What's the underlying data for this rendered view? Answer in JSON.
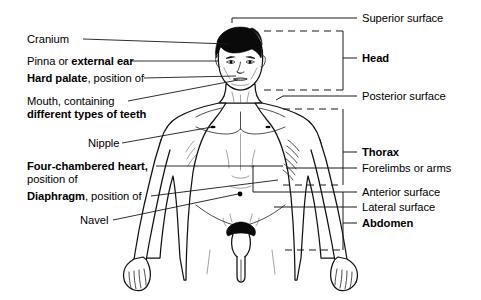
{
  "diagram": {
    "background_color": "#ffffff",
    "ink_color": "#000000",
    "hair_color": "#0a0a0a",
    "leader_line_color": "#1a1a1a",
    "bracket_style": "dashed",
    "figure": {
      "name": "anterior view of male human body",
      "pose": "standing, arms at sides, palms facing forward",
      "shading": "line drawing with stipple shading"
    },
    "left_labels": [
      {
        "id": "cranium",
        "parts": [
          {
            "text": "Cranium",
            "bold": false
          }
        ],
        "points_to": "top of skull"
      },
      {
        "id": "pinna",
        "parts": [
          {
            "text": "Pinna or ",
            "bold": false
          },
          {
            "text": "external ear",
            "bold": true
          }
        ],
        "points_to": "ear"
      },
      {
        "id": "hard-palate",
        "parts": [
          {
            "text": "Hard palate",
            "bold": true
          },
          {
            "text": ", position of",
            "bold": false
          }
        ],
        "points_to": "roof of mouth"
      },
      {
        "id": "mouth-teeth",
        "parts": [
          {
            "text": "Mouth, containing",
            "bold": false
          },
          {
            "text": "different types of teeth",
            "bold": true
          }
        ],
        "points_to": "mouth"
      },
      {
        "id": "nipple",
        "parts": [
          {
            "text": "Nipple",
            "bold": false
          }
        ],
        "points_to": "left nipple"
      },
      {
        "id": "heart",
        "parts": [
          {
            "text": "Four-chambered heart,",
            "bold": true
          },
          {
            "text": "position of",
            "bold": false
          }
        ],
        "points_to": "chest, position of heart"
      },
      {
        "id": "diaphragm",
        "parts": [
          {
            "text": "Diaphragm",
            "bold": true
          },
          {
            "text": ", position of",
            "bold": false
          }
        ],
        "points_to": "lower ribcage"
      },
      {
        "id": "navel",
        "parts": [
          {
            "text": "Navel",
            "bold": false
          }
        ],
        "points_to": "umbilicus"
      }
    ],
    "right_labels": [
      {
        "id": "superior-surface",
        "text": "Superior surface",
        "bold": false,
        "marker": "line"
      },
      {
        "id": "head",
        "text": "Head",
        "bold": true,
        "marker": "bracket"
      },
      {
        "id": "posterior-surface",
        "text": "Posterior surface",
        "bold": false,
        "marker": "line"
      },
      {
        "id": "thorax",
        "text": "Thorax",
        "bold": true,
        "marker": "bracket"
      },
      {
        "id": "forelimbs",
        "text": "Forelimbs or arms",
        "bold": false,
        "marker": "line"
      },
      {
        "id": "anterior-surface",
        "text": "Anterior surface",
        "bold": false,
        "marker": "line"
      },
      {
        "id": "lateral-surface",
        "text": "Lateral surface",
        "bold": false,
        "marker": "line"
      },
      {
        "id": "abdomen",
        "text": "Abdomen",
        "bold": true,
        "marker": "bracket"
      }
    ]
  }
}
